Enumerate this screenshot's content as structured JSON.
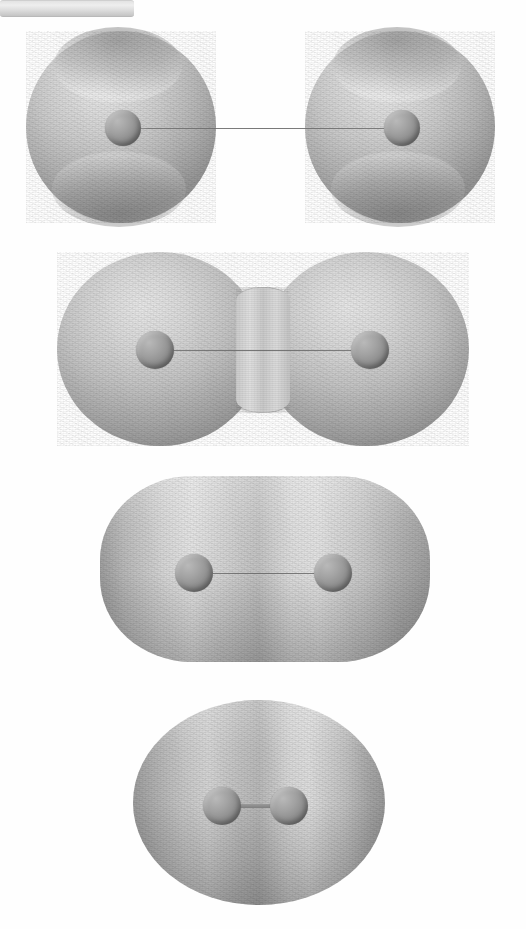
{
  "figure": {
    "background_color": "#ffffff",
    "orientation": "vertical stack, four panels",
    "panel_count": 4,
    "rendering": "shaded grayscale raster, halftone/scanline texture",
    "colors": {
      "background": "#ffffff",
      "surface_highlight": "#e9e9e9",
      "surface_mid": "#c4c4c4",
      "surface_shadow": "#949494",
      "atom_sphere": "#8c8c8c",
      "atom_shadow": "#7b7b7b",
      "bond_light": "#e3e3e3",
      "bond_hairline": "#6e6e6e"
    }
  },
  "panels": [
    {
      "index": 1,
      "label": "panel-a",
      "shape": "two separated spheres joined by a cylindrical bond",
      "topology": "disconnected",
      "isosurface_stage": "low density / large isovalue - atoms resolved separately",
      "bounds": {
        "x": 26,
        "y": 31,
        "width": 470,
        "height": 192
      },
      "lobes": [
        {
          "cx": 121,
          "cy": 127,
          "rx": 95,
          "ry": 96
        },
        {
          "cx": 400,
          "cy": 127,
          "rx": 95,
          "ry": 96
        }
      ],
      "atoms": [
        {
          "cx": 123,
          "cy": 128,
          "r": 18
        },
        {
          "cx": 402,
          "cy": 128,
          "r": 18
        }
      ],
      "bond": {
        "x1": 123,
        "x2": 402,
        "y": 128,
        "thickness": 14,
        "style": "solid cylinder"
      },
      "features": [
        "polar dimple top",
        "polar dimple bottom",
        "specular highlight upper-left"
      ]
    },
    {
      "index": 2,
      "label": "panel-b",
      "shape": "peanut / dumbbell with pinched waist",
      "topology": "connected with narrow neck",
      "isosurface_stage": "intermediate density - lobes merging at a neck",
      "bounds": {
        "x": 57,
        "y": 252,
        "width": 412,
        "height": 194
      },
      "lobes": [
        {
          "cx": 160,
          "cy": 349,
          "rx": 103,
          "ry": 97
        },
        {
          "cx": 366,
          "cy": 349,
          "rx": 103,
          "ry": 97
        }
      ],
      "waist": {
        "x": 263,
        "y_top": 287,
        "y_bottom": 412,
        "width": 62
      },
      "atoms": [
        {
          "cx": 155,
          "cy": 350,
          "r": 19
        },
        {
          "cx": 370,
          "cy": 350,
          "r": 19
        }
      ],
      "bond": {
        "x1": 155,
        "x2": 370,
        "y": 350,
        "thickness": 2,
        "style": "thin hairline"
      },
      "features": [
        "concave saddle at waist",
        "bright band left of waist",
        "bright band right of waist"
      ]
    },
    {
      "index": 3,
      "label": "panel-c",
      "shape": "stadium / rounded rectangle (fully fused, elongated)",
      "topology": "connected convex",
      "isosurface_stage": "higher density - single elongated convex surface",
      "bounds": {
        "x": 100,
        "y": 476,
        "width": 330,
        "height": 186
      },
      "atoms": [
        {
          "cx": 194,
          "cy": 573,
          "r": 19
        },
        {
          "cx": 333,
          "cy": 573,
          "r": 19
        }
      ],
      "bond": {
        "x1": 194,
        "x2": 333,
        "y": 573,
        "thickness": 2,
        "style": "thin hairline"
      },
      "features": [
        "flat top edge",
        "flat bottom edge",
        "two vertical highlight bands"
      ]
    },
    {
      "index": 4,
      "label": "panel-d",
      "shape": "single oblate ellipsoid",
      "topology": "connected convex, near-spherical",
      "isosurface_stage": "highest density - atoms fully enclosed in one oval",
      "bounds": {
        "x": 133,
        "y": 700,
        "width": 252,
        "height": 205
      },
      "atoms": [
        {
          "cx": 222,
          "cy": 806,
          "r": 19
        },
        {
          "cx": 289,
          "cy": 806,
          "r": 19
        }
      ],
      "bond": {
        "x1": 222,
        "x2": 289,
        "y": 806,
        "thickness": 3,
        "style": "short stub"
      },
      "features": [
        "broad central highlight",
        "soft elliptical contour",
        "atoms centered and close"
      ]
    }
  ]
}
